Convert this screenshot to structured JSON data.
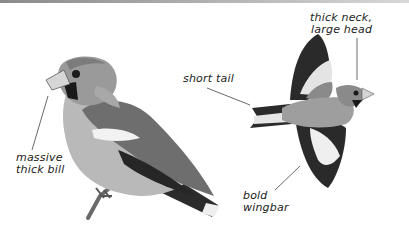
{
  "figure": {
    "colors": {
      "background": "#ffffff",
      "ink": "#222222",
      "dark_plumage": "#2b2b2b",
      "mid_plumage": "#7a7a7a",
      "light_plumage": "#c4c4c4",
      "white_patch": "#f2f2f2"
    },
    "annotations": [
      {
        "id": "bill",
        "lines": [
          "massive",
          "thick bill"
        ]
      },
      {
        "id": "tail",
        "lines": [
          "short tail"
        ]
      },
      {
        "id": "head",
        "lines": [
          "thick neck,",
          "large head"
        ]
      },
      {
        "id": "wing",
        "lines": [
          "bold",
          "wingbar"
        ]
      }
    ]
  }
}
